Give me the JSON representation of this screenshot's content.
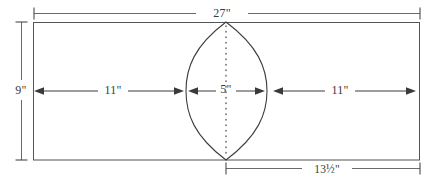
{
  "diagram": {
    "background_color": "#ffffff",
    "outline_color": "#555555",
    "shape_color": "#3d3d3d",
    "dimension_color": "#6a6a6a",
    "label_color": "#3a3a3a",
    "sheet": {
      "name": "rectangular-sheet",
      "width_label": "27\"",
      "height_label": "9\""
    },
    "cutout": {
      "name": "lens-shape",
      "width_label": "5\"",
      "center_line_style": "dotted"
    },
    "dimensions": {
      "top": {
        "label": "27\"",
        "position": "top",
        "orientation": "horizontal"
      },
      "left": {
        "label": "9\"",
        "position": "left",
        "orientation": "vertical"
      },
      "bottom": {
        "label": "13½\"",
        "position": "bottom",
        "orientation": "horizontal"
      },
      "inner_left": {
        "label": "11\"",
        "position": "inner-left",
        "orientation": "horizontal"
      },
      "inner_center": {
        "label": "5\"",
        "position": "inner-center",
        "orientation": "horizontal"
      },
      "inner_right": {
        "label": "11\"",
        "position": "inner-right",
        "orientation": "horizontal"
      }
    }
  }
}
